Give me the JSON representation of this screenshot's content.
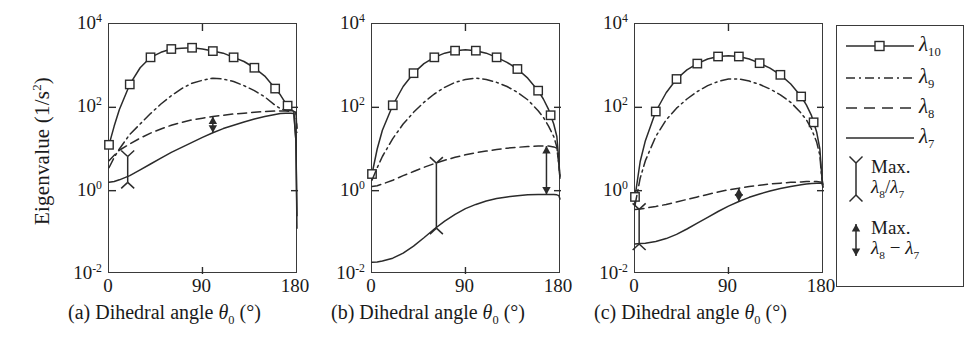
{
  "figure": {
    "ylabel": "Eigenvalue (1/s",
    "ylabel_sup": "2",
    "ylabel_tail": ")",
    "yticks": [
      {
        "label_base": "10",
        "label_exp": "4",
        "value": 4
      },
      {
        "label_base": "10",
        "label_exp": "2",
        "value": 2
      },
      {
        "label_base": "10",
        "label_exp": "0",
        "value": 0
      },
      {
        "label_base": "10",
        "label_exp": "-2",
        "value": -2
      }
    ],
    "xticks": [
      "0",
      "90",
      "180"
    ],
    "xlabel_prefix": "Dihedral angle ",
    "xlabel_symbol": "θ",
    "xlabel_sub": "0",
    "xlabel_unit": " (°)",
    "panel_tags": [
      "(a)",
      "(b)",
      "(c)"
    ],
    "colors": {
      "line": "#2b2b2b",
      "frame": "#3a3a3a",
      "background": "#ffffff"
    }
  },
  "legend": {
    "entries": [
      {
        "symbol": "solid-square-line",
        "lambda": "λ",
        "sub": "10"
      },
      {
        "symbol": "dash-dot-line",
        "lambda": "λ",
        "sub": "9"
      },
      {
        "symbol": "dashed-line",
        "lambda": "λ",
        "sub": "8"
      },
      {
        "symbol": "solid-line",
        "lambda": "λ",
        "sub": "7"
      }
    ],
    "annotations": [
      {
        "symbol": "y-bar-marker",
        "line1": "Max.",
        "l2_a": "λ",
        "l2_a_sub": "8",
        "l2_op": "/",
        "l2_b": "λ",
        "l2_b_sub": "7"
      },
      {
        "symbol": "double-arrow",
        "line1": "Max.",
        "l2_a": "λ",
        "l2_a_sub": "8",
        "l2_op": " − ",
        "l2_b": "λ",
        "l2_b_sub": "7"
      }
    ]
  },
  "chart_data": [
    {
      "type": "line",
      "panel": "(a)",
      "title": "",
      "xlabel": "Dihedral angle θ0 (°)",
      "ylabel": "Eigenvalue (1/s^2)",
      "xlim": [
        0,
        182
      ],
      "ylim_log10": [
        -2,
        4
      ],
      "yscale": "log",
      "grid": false,
      "x": [
        0,
        5,
        10,
        20,
        30,
        40,
        50,
        60,
        70,
        80,
        90,
        100,
        110,
        120,
        130,
        140,
        150,
        160,
        165,
        170,
        175,
        178,
        180,
        181
      ],
      "series": [
        {
          "name": "λ10",
          "style": "solid",
          "marker": "square",
          "marker_x": [
            0,
            20,
            40,
            60,
            80,
            100,
            120,
            140,
            160,
            172
          ],
          "log10_y": [
            1.1,
            1.55,
            1.95,
            2.55,
            2.95,
            3.2,
            3.32,
            3.4,
            3.42,
            3.43,
            3.4,
            3.35,
            3.3,
            3.2,
            3.1,
            2.95,
            2.75,
            2.45,
            2.3,
            2.1,
            1.95,
            1.9,
            1.2,
            -0.6
          ]
        },
        {
          "name": "λ9",
          "style": "dashdot",
          "marker": "none",
          "log10_y": [
            0.55,
            0.8,
            1.0,
            1.35,
            1.6,
            1.85,
            2.08,
            2.28,
            2.45,
            2.58,
            2.65,
            2.7,
            2.68,
            2.62,
            2.52,
            2.4,
            2.25,
            2.05,
            1.97,
            1.93,
            1.92,
            1.92,
            1.9,
            1.4
          ]
        },
        {
          "name": "λ8",
          "style": "dashed",
          "marker": "none",
          "log10_y": [
            0.72,
            0.85,
            0.97,
            1.12,
            1.26,
            1.38,
            1.48,
            1.57,
            1.64,
            1.7,
            1.74,
            1.78,
            1.81,
            1.84,
            1.86,
            1.88,
            1.9,
            1.91,
            1.91,
            1.91,
            1.9,
            1.9,
            1.88,
            1.5
          ]
        },
        {
          "name": "λ7",
          "style": "solid",
          "marker": "none",
          "log10_y": [
            0.2,
            0.22,
            0.26,
            0.36,
            0.5,
            0.64,
            0.78,
            0.92,
            1.04,
            1.16,
            1.28,
            1.39,
            1.49,
            1.57,
            1.65,
            1.72,
            1.78,
            1.83,
            1.85,
            1.86,
            1.86,
            1.85,
            1.2,
            -0.9
          ]
        }
      ],
      "annotations": [
        {
          "kind": "y-bar-marker",
          "label": "Max λ8/λ7",
          "x": 18,
          "log10_y_top": 0.82,
          "log10_y_bottom": 0.2
        },
        {
          "kind": "double-arrow",
          "label": "Max λ8 − λ7",
          "x": 100,
          "log10_y_top": 1.78,
          "log10_y_bottom": 1.39
        }
      ]
    },
    {
      "type": "line",
      "panel": "(b)",
      "title": "",
      "xlabel": "Dihedral angle θ0 (°)",
      "ylabel": "Eigenvalue (1/s^2)",
      "xlim": [
        0,
        182
      ],
      "ylim_log10": [
        -2,
        4
      ],
      "yscale": "log",
      "grid": false,
      "x": [
        0,
        5,
        10,
        20,
        30,
        40,
        50,
        60,
        70,
        80,
        90,
        100,
        110,
        120,
        130,
        140,
        150,
        160,
        165,
        170,
        175,
        178,
        180,
        181
      ],
      "series": [
        {
          "name": "λ10",
          "style": "solid",
          "marker": "square",
          "marker_x": [
            0,
            20,
            40,
            60,
            80,
            100,
            120,
            140,
            160,
            172
          ],
          "log10_y": [
            0.4,
            1.0,
            1.45,
            2.05,
            2.5,
            2.82,
            3.05,
            3.2,
            3.3,
            3.36,
            3.38,
            3.36,
            3.3,
            3.2,
            3.08,
            2.92,
            2.7,
            2.4,
            2.2,
            1.95,
            1.6,
            1.3,
            0.7,
            0.3
          ]
        },
        {
          "name": "λ9",
          "style": "dashdot",
          "marker": "none",
          "log10_y": [
            0.25,
            0.55,
            0.82,
            1.25,
            1.6,
            1.88,
            2.12,
            2.32,
            2.48,
            2.6,
            2.67,
            2.7,
            2.67,
            2.6,
            2.5,
            2.36,
            2.18,
            1.92,
            1.76,
            1.55,
            1.3,
            1.05,
            0.62,
            0.3
          ]
        },
        {
          "name": "λ8",
          "style": "dashed",
          "marker": "none",
          "log10_y": [
            0.1,
            0.12,
            0.16,
            0.25,
            0.36,
            0.46,
            0.56,
            0.65,
            0.73,
            0.8,
            0.86,
            0.91,
            0.95,
            0.99,
            1.02,
            1.04,
            1.06,
            1.07,
            1.07,
            1.07,
            1.05,
            1.02,
            0.62,
            0.3
          ]
        },
        {
          "name": "λ7",
          "style": "solid",
          "marker": "none",
          "log10_y": [
            -1.72,
            -1.71,
            -1.69,
            -1.62,
            -1.5,
            -1.33,
            -1.13,
            -0.92,
            -0.73,
            -0.57,
            -0.43,
            -0.33,
            -0.25,
            -0.19,
            -0.15,
            -0.12,
            -0.1,
            -0.09,
            -0.09,
            -0.09,
            -0.09,
            -0.1,
            -0.12,
            -0.2
          ]
        }
      ],
      "annotations": [
        {
          "kind": "y-bar-marker",
          "label": "Max λ8/λ7",
          "x": 62,
          "log10_y_top": 0.66,
          "log10_y_bottom": -0.9
        },
        {
          "kind": "double-arrow",
          "label": "Max λ8 − λ7",
          "x": 168,
          "log10_y_top": 1.07,
          "log10_y_bottom": -0.09
        }
      ]
    },
    {
      "type": "line",
      "panel": "(c)",
      "title": "",
      "xlabel": "Dihedral angle θ0 (°)",
      "ylabel": "Eigenvalue (1/s^2)",
      "xlim": [
        0,
        182
      ],
      "ylim_log10": [
        -2,
        4
      ],
      "yscale": "log",
      "grid": false,
      "x": [
        0,
        5,
        10,
        20,
        30,
        40,
        50,
        60,
        70,
        80,
        90,
        100,
        110,
        120,
        130,
        140,
        150,
        160,
        165,
        170,
        175,
        178,
        180,
        181
      ],
      "series": [
        {
          "name": "λ10",
          "style": "solid",
          "marker": "square",
          "marker_x": [
            0,
            20,
            40,
            60,
            80,
            100,
            120,
            140,
            160,
            172
          ],
          "log10_y": [
            -0.15,
            0.7,
            1.2,
            1.9,
            2.35,
            2.68,
            2.9,
            3.05,
            3.16,
            3.22,
            3.24,
            3.22,
            3.16,
            3.06,
            2.94,
            2.78,
            2.56,
            2.26,
            2.06,
            1.8,
            1.4,
            1.0,
            0.3,
            0.15
          ]
        },
        {
          "name": "λ9",
          "style": "dashdot",
          "marker": "none",
          "log10_y": [
            -0.35,
            0.3,
            0.72,
            1.3,
            1.7,
            1.98,
            2.2,
            2.38,
            2.52,
            2.62,
            2.68,
            2.68,
            2.63,
            2.55,
            2.44,
            2.3,
            2.12,
            1.86,
            1.7,
            1.48,
            1.16,
            0.85,
            0.25,
            0.1
          ]
        },
        {
          "name": "λ8",
          "style": "dashed",
          "marker": "none",
          "log10_y": [
            -0.45,
            -0.44,
            -0.42,
            -0.38,
            -0.33,
            -0.27,
            -0.21,
            -0.15,
            -0.09,
            -0.03,
            0.02,
            0.06,
            0.1,
            0.13,
            0.16,
            0.18,
            0.2,
            0.21,
            0.22,
            0.22,
            0.22,
            0.21,
            0.2,
            0.1
          ]
        },
        {
          "name": "λ7",
          "style": "solid",
          "marker": "none",
          "log10_y": [
            -1.28,
            -1.27,
            -1.26,
            -1.22,
            -1.15,
            -1.05,
            -0.92,
            -0.78,
            -0.64,
            -0.5,
            -0.37,
            -0.26,
            -0.16,
            -0.08,
            -0.01,
            0.05,
            0.1,
            0.14,
            0.16,
            0.17,
            0.18,
            0.18,
            0.18,
            0.08
          ]
        }
      ],
      "annotations": [
        {
          "kind": "y-bar-marker",
          "label": "Max λ8/λ7",
          "x": 4,
          "log10_y_top": -0.45,
          "log10_y_bottom": -1.28
        },
        {
          "kind": "double-arrow",
          "label": "Max λ8 − λ7",
          "x": 100,
          "log10_y_top": 0.06,
          "log10_y_bottom": -0.26
        }
      ]
    }
  ]
}
